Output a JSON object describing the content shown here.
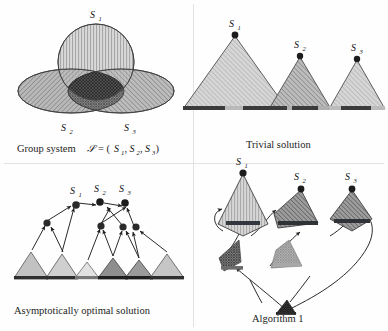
{
  "figure": {
    "panels": [
      {
        "id": "group-system",
        "caption": "Group system",
        "caption_math_prefix": "Group system",
        "caption_math": "ᵊe = (S₁, S₂, S₃)",
        "caption_full": "Group system S = (S1, S2, S3)",
        "labels": [
          "S",
          "S",
          "S"
        ],
        "label_subs": [
          "1",
          "2",
          "3"
        ],
        "shapes": [
          {
            "name": "S1",
            "kind": "circle",
            "hatch": "vertical",
            "fill": "#d9d9d9"
          },
          {
            "name": "S2",
            "kind": "ellipse",
            "hatch": "diagonal-down",
            "fill": "#b4b4b4"
          },
          {
            "name": "S3",
            "kind": "ellipse",
            "hatch": "diagonal-up",
            "fill": "#b4b4b4"
          }
        ],
        "intersection": {
          "name": "triple-intersection",
          "hatch": "cross",
          "fill": "#6e6e6e"
        }
      },
      {
        "id": "trivial-solution",
        "caption": "Trivial solution",
        "labels": [
          "S",
          "S",
          "S"
        ],
        "label_subs": [
          "1",
          "2",
          "3"
        ],
        "triangles": [
          {
            "name": "S1",
            "width": 104,
            "height": 74,
            "fill": "#d2d2d2",
            "hatch": "diagonal-up",
            "bar_fill": "#3c3c3c"
          },
          {
            "name": "S2",
            "width": 62,
            "height": 52,
            "fill": "#b8b8b8",
            "hatch": "diagonal-up",
            "bar_fill": "#3c3c3c"
          },
          {
            "name": "S3",
            "width": 56,
            "height": 48,
            "fill": "#cfcfcf",
            "hatch": "diagonal-up",
            "bar_fill": "#3c3c3c"
          }
        ]
      },
      {
        "id": "asymptotically-optimal-solution",
        "caption": "Asymptotically optimal solution",
        "labels": [
          "S",
          "S",
          "S"
        ],
        "label_subs": [
          "1",
          "2",
          "3"
        ],
        "node_count": 8,
        "edge_count": 14,
        "triangles": [
          {
            "name": "leaf-1",
            "fill": "#c2c2c2"
          },
          {
            "name": "leaf-2",
            "fill": "#cfcfcf"
          },
          {
            "name": "leaf-3",
            "fill": "#e0e0e0"
          },
          {
            "name": "leaf-4",
            "fill": "#8e8e8e"
          },
          {
            "name": "leaf-5",
            "fill": "#9a9a9a"
          },
          {
            "name": "leaf-6",
            "fill": "#c6c6c6"
          }
        ]
      },
      {
        "id": "algorithm-1",
        "caption": "Algorithm 1",
        "labels": [
          "S",
          "S",
          "S"
        ],
        "label_subs": [
          "1",
          "2",
          "3"
        ],
        "kites": [
          {
            "name": "S1",
            "hatch": "vertical",
            "fill": "#d0d0d0",
            "bar_fill": "#33383f"
          },
          {
            "name": "S2",
            "hatch": "diagonal-up",
            "fill": "#9c9c9c",
            "bar_fill": "#2f3338"
          },
          {
            "name": "S3",
            "hatch": "diagonal-up",
            "fill": "#a8a8a8",
            "bar_fill": "#2f3338"
          }
        ],
        "small_kites": [
          {
            "name": "small-left",
            "fill": "#b6b6b6",
            "bar_fill": "#6c6c6c"
          },
          {
            "name": "small-mid",
            "fill": "#d7d7d7",
            "bar_fill": "#a0a0a0"
          }
        ],
        "root": {
          "name": "root-node",
          "fill": "#5a5a5a"
        }
      }
    ]
  }
}
